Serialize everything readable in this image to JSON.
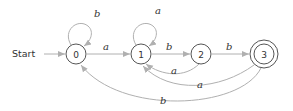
{
  "start_label": "Start",
  "colors": {
    "edge": "#b0b0b0",
    "node_stroke": "#555555",
    "text": "#333333"
  },
  "states": [
    {
      "id": "0",
      "label": "0",
      "accepting": false
    },
    {
      "id": "1",
      "label": "1",
      "accepting": false
    },
    {
      "id": "2",
      "label": "2",
      "accepting": false
    },
    {
      "id": "3",
      "label": "3",
      "accepting": true
    }
  ],
  "transitions": [
    {
      "from": "0",
      "to": "0",
      "label": "b"
    },
    {
      "from": "0",
      "to": "1",
      "label": "a"
    },
    {
      "from": "1",
      "to": "1",
      "label": "a"
    },
    {
      "from": "1",
      "to": "2",
      "label": "b"
    },
    {
      "from": "2",
      "to": "3",
      "label": "b"
    },
    {
      "from": "2",
      "to": "1",
      "label": "a"
    },
    {
      "from": "3",
      "to": "1",
      "label": "a"
    },
    {
      "from": "3",
      "to": "0",
      "label": "b"
    }
  ]
}
